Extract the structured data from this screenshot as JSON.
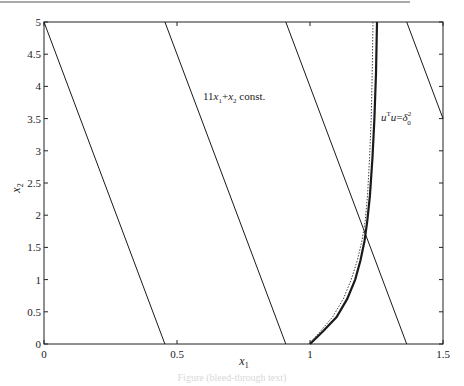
{
  "chart_data": {
    "type": "line",
    "title": "",
    "xlabel": "x1",
    "ylabel": "x2",
    "xlim": [
      0,
      1.5
    ],
    "ylim": [
      0,
      5
    ],
    "grid": false,
    "x_ticks": [
      "0",
      "0.5",
      "1",
      "1.5"
    ],
    "x_tick_values": [
      0,
      0.5,
      1,
      1.5
    ],
    "y_ticks": [
      "0",
      "0.5",
      "1",
      "1.5",
      "2",
      "2.5",
      "3",
      "3.5",
      "4",
      "4.5",
      "5"
    ],
    "y_tick_values": [
      0,
      0.5,
      1,
      1.5,
      2,
      2.5,
      3,
      3.5,
      4,
      4.5,
      5
    ],
    "series": [
      {
        "name": "11x1+x2 = 5",
        "style": "solid-thin",
        "x": [
          0,
          0.4545
        ],
        "y": [
          5,
          0
        ]
      },
      {
        "name": "11x1+x2 = 10",
        "style": "solid-thin",
        "x": [
          0.4545,
          0.9091
        ],
        "y": [
          5,
          0
        ]
      },
      {
        "name": "11x1+x2 = 15",
        "style": "solid-thin",
        "x": [
          0.9091,
          1.3636
        ],
        "y": [
          5,
          0
        ]
      },
      {
        "name": "11x1+x2 = 20",
        "style": "solid-thin",
        "x": [
          1.3636,
          1.5
        ],
        "y": [
          5,
          3.5
        ]
      },
      {
        "name": "uTu = delta0^2 (solid)",
        "style": "solid-thick",
        "x": [
          1.0,
          1.05,
          1.1,
          1.14,
          1.17,
          1.19,
          1.205,
          1.215,
          1.225,
          1.235,
          1.242,
          1.248,
          1.252
        ],
        "y": [
          0.0,
          0.2,
          0.42,
          0.7,
          1.0,
          1.3,
          1.6,
          1.9,
          2.3,
          2.9,
          3.5,
          4.2,
          5.0
        ]
      },
      {
        "name": "approximation (dotted)",
        "style": "dotted",
        "x": [
          0.995,
          1.04,
          1.085,
          1.125,
          1.155,
          1.178,
          1.195,
          1.207,
          1.216,
          1.224,
          1.23,
          1.234,
          1.237
        ],
        "y": [
          0.0,
          0.2,
          0.42,
          0.7,
          1.0,
          1.3,
          1.6,
          1.9,
          2.3,
          2.9,
          3.5,
          4.2,
          5.0
        ]
      }
    ],
    "annotations": [
      {
        "text": "11x1+x2 const.",
        "x": 0.59,
        "y": 3.85
      },
      {
        "text": "uTu=δ0²",
        "x": 1.26,
        "y": 3.62
      }
    ]
  },
  "labels": {
    "xlabel_main": "x",
    "xlabel_sub": "1",
    "ylabel_main": "x",
    "ylabel_sub": "2",
    "annot1_a": "11",
    "annot1_b": "x",
    "annot1_c": "1",
    "annot1_d": "+",
    "annot1_e": "x",
    "annot1_f": "2",
    "annot1_g": " const.",
    "annot2_a": "u",
    "annot2_b": "T",
    "annot2_c": "u",
    "annot2_d": "=",
    "annot2_e": "δ",
    "annot2_f": "2",
    "annot2_g": "0",
    "caption": "Figure (bleed-through text)"
  }
}
